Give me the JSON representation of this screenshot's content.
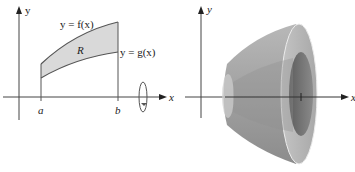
{
  "figure": {
    "left": {
      "axis_x_label": "x",
      "axis_y_label": "y",
      "upper_curve_label": "y = f(x)",
      "lower_curve_label": "y = g(x)",
      "region_label": "R",
      "tick_a_label": "a",
      "tick_b_label": "b",
      "rotation_icon": "rotation-arrow-about-x-axis",
      "region_fill": "#d9d9d9",
      "curve_color": "#555555"
    },
    "right": {
      "axis_x_label": "x",
      "axis_y_label": "y",
      "solid_description": "washer-shaped solid of revolution",
      "solid_outer_color": "#9a9a9a",
      "solid_inner_color": "#6f6f6f"
    }
  }
}
